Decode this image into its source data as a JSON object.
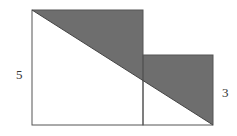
{
  "diagram": {
    "type": "geometry",
    "large_square": {
      "side_label": "5"
    },
    "small_square": {
      "side_label": "3"
    },
    "colors": {
      "shade": "#6e6e6e",
      "stroke": "#555555",
      "background": "#ffffff",
      "text": "#333333"
    }
  }
}
